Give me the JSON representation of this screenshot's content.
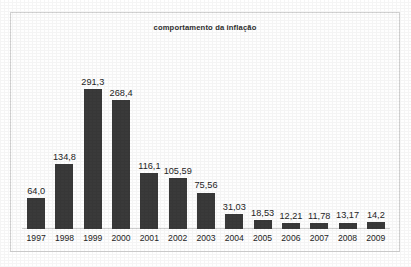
{
  "chart_data": {
    "type": "bar",
    "title": "comportamento da inflação",
    "xlabel": "",
    "ylabel": "",
    "grid": false,
    "legend": null,
    "ylim": [
      0,
      291.3
    ],
    "categories": [
      "1997",
      "1998",
      "1999",
      "2000",
      "2001",
      "2002",
      "2003",
      "2004",
      "2005",
      "2006",
      "2007",
      "2008",
      "2009"
    ],
    "values": [
      64.0,
      134.8,
      291.3,
      268.4,
      116.1,
      105.59,
      75.56,
      31.03,
      18.53,
      12.21,
      11.78,
      13.17,
      14.2
    ],
    "value_labels": [
      "64,0",
      "134,8",
      "291,3",
      "268,4",
      "116,1",
      "105,59",
      "75,56",
      "31,03",
      "18,53",
      "12,21",
      "11,78",
      "13,17",
      "14,2"
    ],
    "bar_color": "#3a3a3a",
    "background_color": "#ffffff",
    "border_color": "#d2d2d2",
    "axis_line_color": "#cfcfcf"
  }
}
